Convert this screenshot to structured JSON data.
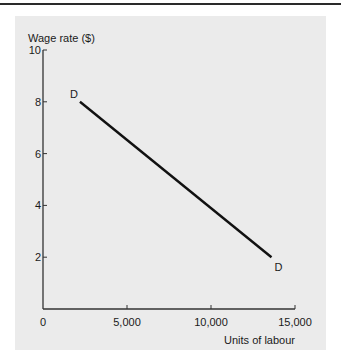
{
  "chart_data": {
    "type": "line",
    "title": "",
    "xlabel": "Units of labour",
    "ylabel": "Wage rate ($)",
    "xlim": [
      0,
      15000
    ],
    "ylim": [
      0,
      10
    ],
    "x_ticks": [
      0,
      5000,
      10000,
      15000
    ],
    "x_tick_labels": [
      "0",
      "5,000",
      "10,000",
      "15,000"
    ],
    "y_ticks": [
      2,
      4,
      6,
      8,
      10
    ],
    "y_tick_labels": [
      "2",
      "4",
      "6",
      "8",
      "10"
    ],
    "grid": false,
    "legend": null,
    "series": [
      {
        "name": "D",
        "x": [
          2200,
          13600
        ],
        "y": [
          8,
          2
        ],
        "color": "#111111"
      }
    ],
    "annotations": [
      {
        "text": "D",
        "x": 2200,
        "y": 8,
        "position": "upper-left"
      },
      {
        "text": "D",
        "x": 13600,
        "y": 2,
        "position": "lower-right"
      }
    ]
  },
  "colors": {
    "panel_background": "#ebebeb",
    "axis": "#333333",
    "line": "#111111"
  }
}
